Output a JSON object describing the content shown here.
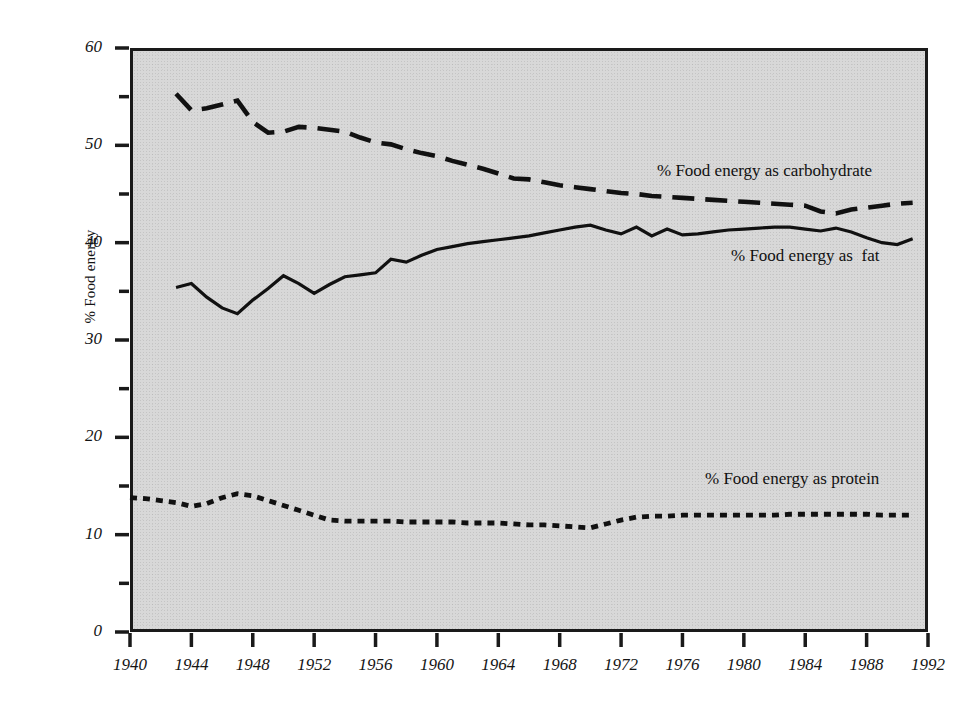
{
  "chart_data": {
    "type": "line",
    "title": "",
    "subtitle": "",
    "xlabel": "",
    "ylabel": "% Food energy",
    "xlim": [
      1940,
      1992
    ],
    "ylim": [
      0,
      60
    ],
    "grid": false,
    "legend_position": "in-plot-right",
    "background_color": "#d8d8d8",
    "line_color": "#111111",
    "x_major_ticks": [
      1940,
      1944,
      1948,
      1952,
      1956,
      1960,
      1964,
      1968,
      1972,
      1976,
      1980,
      1984,
      1988,
      1992
    ],
    "x_tick_labels": [
      "1940",
      "1944",
      "1948",
      "1952",
      "1956",
      "1960",
      "1964",
      "1968",
      "1972",
      "1976",
      "1980",
      "1984",
      "1988",
      "1992"
    ],
    "y_major_ticks": [
      0,
      10,
      20,
      30,
      40,
      50,
      60
    ],
    "y_tick_labels": [
      "0",
      "10",
      "20",
      "30",
      "40",
      "50",
      "60"
    ],
    "y_minor_ticks": [
      5,
      15,
      25,
      35,
      45,
      55
    ],
    "series": [
      {
        "name": "% Food energy as carbohydrate",
        "style": "dashed",
        "label_text": "% Food energy as carbohydrate",
        "x": [
          1943,
          1944,
          1945,
          1946,
          1947,
          1948,
          1949,
          1950,
          1951,
          1952,
          1953,
          1954,
          1955,
          1956,
          1957,
          1958,
          1959,
          1960,
          1961,
          1962,
          1963,
          1964,
          1965,
          1966,
          1967,
          1968,
          1969,
          1970,
          1971,
          1972,
          1973,
          1974,
          1975,
          1976,
          1977,
          1978,
          1979,
          1980,
          1981,
          1982,
          1983,
          1984,
          1985,
          1986,
          1987,
          1988,
          1989,
          1990,
          1991
        ],
        "values": [
          55.3,
          53.6,
          53.8,
          54.2,
          54.6,
          52.4,
          51.3,
          51.4,
          51.9,
          51.8,
          51.6,
          51.4,
          50.8,
          50.3,
          50.1,
          49.6,
          49.2,
          48.9,
          48.4,
          48.0,
          47.6,
          47.1,
          46.6,
          46.5,
          46.2,
          45.9,
          45.7,
          45.5,
          45.3,
          45.1,
          45.0,
          44.8,
          44.7,
          44.6,
          44.5,
          44.4,
          44.3,
          44.2,
          44.1,
          44.0,
          43.9,
          43.8,
          43.2,
          43.0,
          43.4,
          43.6,
          43.8,
          44.0,
          44.1
        ]
      },
      {
        "name": "% Food energy as fat",
        "style": "solid",
        "label_text": "% Food energy as  fat",
        "x": [
          1943,
          1944,
          1945,
          1946,
          1947,
          1948,
          1949,
          1950,
          1951,
          1952,
          1953,
          1954,
          1955,
          1956,
          1957,
          1958,
          1959,
          1960,
          1961,
          1962,
          1963,
          1964,
          1965,
          1966,
          1967,
          1968,
          1969,
          1970,
          1971,
          1972,
          1973,
          1974,
          1975,
          1976,
          1977,
          1978,
          1979,
          1980,
          1981,
          1982,
          1983,
          1984,
          1985,
          1986,
          1987,
          1988,
          1989,
          1990,
          1991
        ],
        "values": [
          35.4,
          35.8,
          34.4,
          33.3,
          32.7,
          34.1,
          35.3,
          36.6,
          35.8,
          34.8,
          35.7,
          36.5,
          36.7,
          36.9,
          38.3,
          38.0,
          38.7,
          39.3,
          39.6,
          39.9,
          40.1,
          40.3,
          40.5,
          40.7,
          41.0,
          41.3,
          41.6,
          41.8,
          41.3,
          40.9,
          41.6,
          40.7,
          41.4,
          40.8,
          40.9,
          41.1,
          41.3,
          41.4,
          41.5,
          41.6,
          41.6,
          41.4,
          41.2,
          41.5,
          41.1,
          40.5,
          40.0,
          39.8,
          40.4
        ]
      },
      {
        "name": "% Food energy as protein",
        "style": "dotted",
        "label_text": "% Food energy as protein",
        "x": [
          1940,
          1941,
          1942,
          1943,
          1944,
          1945,
          1946,
          1947,
          1948,
          1949,
          1950,
          1951,
          1952,
          1953,
          1954,
          1955,
          1956,
          1957,
          1958,
          1959,
          1960,
          1961,
          1962,
          1963,
          1964,
          1965,
          1966,
          1967,
          1968,
          1969,
          1970,
          1971,
          1972,
          1973,
          1974,
          1975,
          1976,
          1977,
          1978,
          1979,
          1980,
          1981,
          1982,
          1983,
          1984,
          1985,
          1986,
          1987,
          1988,
          1989,
          1990,
          1991
        ],
        "values": [
          13.8,
          13.7,
          13.5,
          13.3,
          12.9,
          13.2,
          13.8,
          14.2,
          14.0,
          13.5,
          13.0,
          12.5,
          12.0,
          11.5,
          11.4,
          11.4,
          11.4,
          11.4,
          11.3,
          11.3,
          11.3,
          11.3,
          11.2,
          11.2,
          11.2,
          11.1,
          11.0,
          11.0,
          10.9,
          10.8,
          10.7,
          11.1,
          11.5,
          11.8,
          11.9,
          11.9,
          12.0,
          12.0,
          12.0,
          12.0,
          12.0,
          12.0,
          12.0,
          12.1,
          12.1,
          12.1,
          12.1,
          12.1,
          12.1,
          12.0,
          12.0,
          12.0
        ]
      }
    ]
  }
}
